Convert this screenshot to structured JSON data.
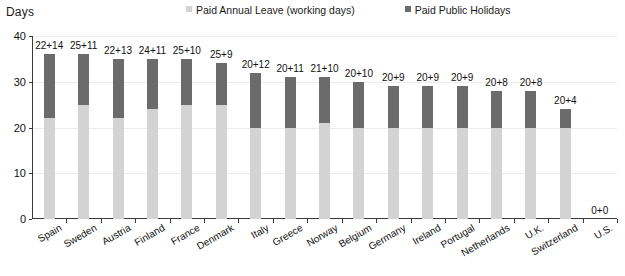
{
  "axis_title": "Days",
  "legend": {
    "position": "top",
    "items": [
      {
        "label": "Paid Annual Leave (working days)",
        "color": "#d3d3d3",
        "name": "paid-annual-leave"
      },
      {
        "label": "Paid Public Holidays",
        "color": "#6b6b6b",
        "name": "paid-public-holidays"
      }
    ]
  },
  "colors": {
    "annual_leave": "#d3d3d3",
    "public_holidays": "#6b6b6b",
    "axis": "#3a3a3a",
    "gridline": "#ececec",
    "text": "#111111",
    "background": "#ffffff"
  },
  "y_axis": {
    "min": 0,
    "max": 40,
    "ticks": [
      0,
      10,
      20,
      30,
      40
    ],
    "tick_labels": [
      "0",
      "10",
      "20",
      "30",
      "40"
    ]
  },
  "chart_data": {
    "type": "bar",
    "subtype": "stacked-bar",
    "title": "",
    "xlabel": "",
    "ylabel": "Days",
    "ylim": [
      0,
      40
    ],
    "grid": true,
    "legend_position": "top",
    "categories": [
      "Spain",
      "Sweden",
      "Austria",
      "Finland",
      "France",
      "Denmark",
      "Italy",
      "Greece",
      "Norway",
      "Belgium",
      "Germany",
      "Ireland",
      "Portugal",
      "Netherlands",
      "U.K.",
      "Switzerland",
      "U.S."
    ],
    "series": [
      {
        "name": "Paid Annual Leave (working days)",
        "color": "#d3d3d3",
        "values": [
          22,
          25,
          22,
          24,
          25,
          25,
          20,
          20,
          21,
          20,
          20,
          20,
          20,
          20,
          20,
          20,
          0
        ]
      },
      {
        "name": "Paid Public Holidays",
        "color": "#6b6b6b",
        "values": [
          14,
          11,
          13,
          11,
          10,
          9,
          12,
          11,
          10,
          10,
          9,
          9,
          9,
          8,
          8,
          4,
          0
        ]
      }
    ],
    "totals": [
      36,
      36,
      35,
      35,
      35,
      34,
      32,
      31,
      31,
      30,
      29,
      29,
      29,
      28,
      28,
      24,
      0
    ],
    "data_labels": [
      "22+14",
      "25+11",
      "22+13",
      "24+11",
      "25+10",
      "25+9",
      "20+12",
      "20+11",
      "21+10",
      "20+10",
      "20+9",
      "20+9",
      "20+9",
      "20+8",
      "20+8",
      "20+4",
      "0+0"
    ]
  }
}
